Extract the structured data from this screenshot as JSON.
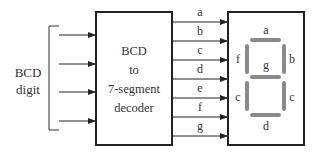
{
  "input": {
    "label_line1": "BCD",
    "label_line2": "digit",
    "count": 4
  },
  "decoder": {
    "line1": "BCD",
    "line2": "to",
    "line3": "7-segment",
    "line4": "decoder"
  },
  "outputs": [
    "a",
    "b",
    "c",
    "d",
    "e",
    "f",
    "g"
  ],
  "display": {
    "segment_labels": {
      "top": "a",
      "upper_right": "b",
      "lower_right": "c",
      "bottom": "d",
      "lower_left": "c",
      "upper_left": "f",
      "middle": "g"
    },
    "segment_color": "#8a8a8a"
  }
}
